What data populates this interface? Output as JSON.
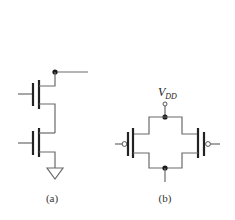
{
  "figure": {
    "panels": [
      {
        "id": "a",
        "label": "(a)",
        "description": "Two stacked NMOS transistors in series, top drain connected to output node (dot), bottom source to ground"
      },
      {
        "id": "b",
        "label": "(b)",
        "description": "Two PMOS transistors in parallel between VDD and a common output node",
        "supply_label": "V",
        "supply_subscript": "DD"
      }
    ]
  }
}
